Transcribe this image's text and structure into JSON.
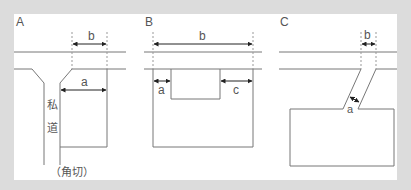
{
  "colors": {
    "background": "#dcdcdc",
    "panel": "#ffffff",
    "line": "#666666",
    "dashed": "#999999",
    "text": "#555555"
  },
  "panels": [
    {
      "id": "A",
      "title": "A",
      "labels": {
        "b": "b",
        "a": "a",
        "road_char_1": "私",
        "road_char_2": "道",
        "caption": "（角切）"
      }
    },
    {
      "id": "B",
      "title": "B",
      "labels": {
        "b": "b",
        "a": "a",
        "c": "c"
      }
    },
    {
      "id": "C",
      "title": "C",
      "labels": {
        "b": "b",
        "a": "a"
      }
    }
  ]
}
